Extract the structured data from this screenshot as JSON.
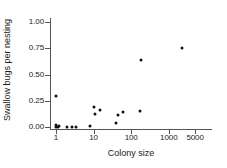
{
  "chart_data": {
    "type": "scatter",
    "title": "",
    "xlabel": "Colony size",
    "ylabel": "Swallow bugs per nesting",
    "xscale": "log",
    "yscale": "linear",
    "xlim": [
      0.7,
      9000
    ],
    "ylim": [
      -0.05,
      1.1
    ],
    "grid": false,
    "legend": null,
    "xticks": [
      {
        "value": 1,
        "label": "1"
      },
      {
        "value": 10,
        "label": "10"
      },
      {
        "value": 100,
        "label": "100"
      },
      {
        "value": 1000,
        "label": "1000"
      },
      {
        "value": 5000,
        "label": "5000"
      }
    ],
    "yticks": [
      {
        "value": 0.0,
        "label": "0.00"
      },
      {
        "value": 0.25,
        "label": "0.25"
      },
      {
        "value": 0.5,
        "label": "0.50"
      },
      {
        "value": 0.75,
        "label": "0.75"
      },
      {
        "value": 1.0,
        "label": "1.00"
      }
    ],
    "marker": {
      "shape": "circle",
      "color": "#111111",
      "size": 3
    },
    "points": [
      {
        "x": 1,
        "y": 0.3
      },
      {
        "x": 1,
        "y": 0.02
      },
      {
        "x": 1,
        "y": 0.0
      },
      {
        "x": 1.2,
        "y": 0.01
      },
      {
        "x": 1.1,
        "y": 0.0
      },
      {
        "x": 2,
        "y": 0.0
      },
      {
        "x": 2.6,
        "y": 0.0
      },
      {
        "x": 3.5,
        "y": 0.0
      },
      {
        "x": 8,
        "y": 0.005
      },
      {
        "x": 10,
        "y": 0.19
      },
      {
        "x": 11,
        "y": 0.12
      },
      {
        "x": 15,
        "y": 0.16
      },
      {
        "x": 40,
        "y": 0.04
      },
      {
        "x": 45,
        "y": 0.11
      },
      {
        "x": 60,
        "y": 0.14
      },
      {
        "x": 170,
        "y": 0.155
      },
      {
        "x": 180,
        "y": 0.635
      },
      {
        "x": 2200,
        "y": 0.755
      }
    ]
  },
  "axis": {
    "x_title": "Colony size",
    "y_title": "Swallow bugs per nesting"
  }
}
